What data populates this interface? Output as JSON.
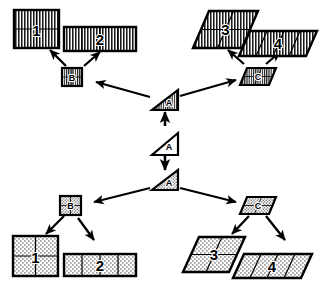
{
  "diagram": {
    "background_color": "#ffffff",
    "ink_color": "#000000",
    "canvas": {
      "width": 327,
      "height": 285
    },
    "root_node": {
      "id": "A-mid",
      "label": "A",
      "shape": "triangle",
      "fill": "plain"
    },
    "fills": {
      "plain": "white / unfilled",
      "hatch": "vertical line hatching",
      "stipple": "dotted stipple texture"
    },
    "nodes": [
      {
        "id": "A-top",
        "label": "A",
        "shape": "triangle",
        "fill": "hatch",
        "size": "small"
      },
      {
        "id": "A-mid",
        "label": "A",
        "shape": "triangle",
        "fill": "plain",
        "size": "small"
      },
      {
        "id": "A-bot",
        "label": "A",
        "shape": "triangle",
        "fill": "stipple",
        "size": "small"
      },
      {
        "id": "B-top",
        "label": "B",
        "shape": "square",
        "fill": "hatch",
        "size": "small"
      },
      {
        "id": "C-top",
        "label": "C",
        "shape": "parallelogram",
        "fill": "hatch",
        "size": "small"
      },
      {
        "id": "B-bot",
        "label": "B",
        "shape": "square",
        "fill": "stipple",
        "size": "small"
      },
      {
        "id": "C-bot",
        "label": "C",
        "shape": "parallelogram",
        "fill": "stipple",
        "size": "small"
      },
      {
        "id": "S1-top",
        "label": "1",
        "shape": "square",
        "fill": "hatch",
        "size": "large",
        "divisions": "2x2"
      },
      {
        "id": "S2-top",
        "label": "2",
        "shape": "rectangle",
        "fill": "hatch",
        "size": "large",
        "divisions": "1x4"
      },
      {
        "id": "P3-top",
        "label": "3",
        "shape": "parallelogram",
        "fill": "hatch",
        "size": "large",
        "divisions": "2x2"
      },
      {
        "id": "P4-top",
        "label": "4",
        "shape": "parallelogram",
        "fill": "hatch",
        "size": "large",
        "divisions": "1x4"
      },
      {
        "id": "S1-bot",
        "label": "1",
        "shape": "square",
        "fill": "stipple",
        "size": "large",
        "divisions": "2x2"
      },
      {
        "id": "S2-bot",
        "label": "2",
        "shape": "rectangle",
        "fill": "stipple",
        "size": "large",
        "divisions": "1x4"
      },
      {
        "id": "P3-bot",
        "label": "3",
        "shape": "parallelogram",
        "fill": "stipple",
        "size": "large",
        "divisions": "2x2"
      },
      {
        "id": "P4-bot",
        "label": "4",
        "shape": "parallelogram",
        "fill": "stipple",
        "size": "large",
        "divisions": "1x4"
      }
    ],
    "edges": [
      {
        "from": "A-mid",
        "to": "A-top",
        "direction": "up"
      },
      {
        "from": "A-mid",
        "to": "A-bot",
        "direction": "down"
      },
      {
        "from": "A-top",
        "to": "B-top",
        "direction": "up-left"
      },
      {
        "from": "A-top",
        "to": "C-top",
        "direction": "up-right"
      },
      {
        "from": "A-bot",
        "to": "B-bot",
        "direction": "down-left"
      },
      {
        "from": "A-bot",
        "to": "C-bot",
        "direction": "down-right"
      },
      {
        "from": "B-top",
        "to": "S1-top",
        "direction": "up-left"
      },
      {
        "from": "B-top",
        "to": "S2-top",
        "direction": "up-right"
      },
      {
        "from": "C-top",
        "to": "P3-top",
        "direction": "up-left"
      },
      {
        "from": "C-top",
        "to": "P4-top",
        "direction": "up-right"
      },
      {
        "from": "B-bot",
        "to": "S1-bot",
        "direction": "down-left"
      },
      {
        "from": "B-bot",
        "to": "S2-bot",
        "direction": "down-right"
      },
      {
        "from": "C-bot",
        "to": "P3-bot",
        "direction": "down-left"
      },
      {
        "from": "C-bot",
        "to": "P4-bot",
        "direction": "down-right"
      }
    ],
    "labels": {
      "A": "A",
      "B": "B",
      "C": "C",
      "one": "1",
      "two": "2",
      "three": "3",
      "four": "4"
    }
  }
}
